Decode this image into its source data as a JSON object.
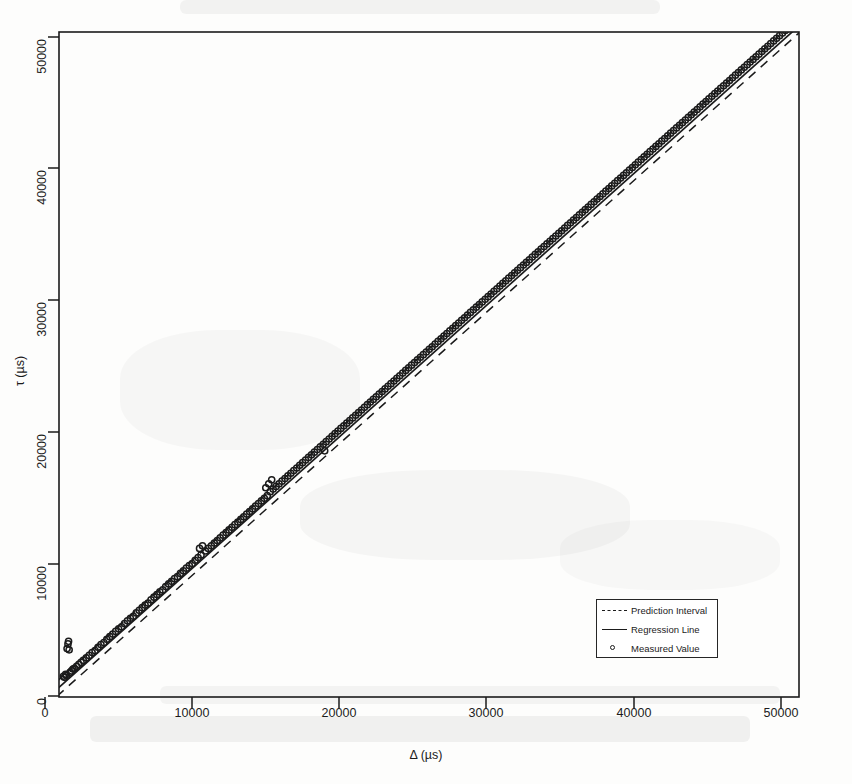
{
  "chart_data": {
    "type": "scatter",
    "title": "",
    "xlabel": "Δ (µs)",
    "ylabel": "τ (µs)",
    "xlim": [
      -1200,
      52500
    ],
    "ylim": [
      -1200,
      52500
    ],
    "xticks": [
      0,
      10000,
      20000,
      30000,
      40000,
      50000
    ],
    "yticks": [
      0,
      10000,
      20000,
      30000,
      40000,
      50000
    ],
    "xticklabels": [
      "0",
      "10000",
      "20000",
      "30000",
      "40000",
      "50000"
    ],
    "yticklabels": [
      "0",
      "10000",
      "20000",
      "30000",
      "40000",
      "50000"
    ],
    "grid": false,
    "legend_position": "bottom-right",
    "series": [
      {
        "name": "Measured Value",
        "type": "scatter",
        "marker": "open-circle",
        "color": "#1b1b1b",
        "points": [
          [
            1250,
            1500
          ],
          [
            1320,
            1420
          ],
          [
            1400,
            1650
          ],
          [
            1460,
            1560
          ],
          [
            1500,
            3600
          ],
          [
            1560,
            3950
          ],
          [
            1600,
            4150
          ],
          [
            1640,
            3500
          ],
          [
            1700,
            1800
          ],
          [
            1800,
            1900
          ],
          [
            1900,
            2050
          ],
          [
            2000,
            2100
          ],
          [
            2150,
            2250
          ],
          [
            2300,
            2400
          ],
          [
            2450,
            2550
          ],
          [
            2600,
            2700
          ],
          [
            2800,
            2900
          ],
          [
            3000,
            3080
          ],
          [
            3200,
            3300
          ],
          [
            3400,
            3450
          ],
          [
            3600,
            3700
          ],
          [
            3800,
            3900
          ],
          [
            4000,
            4050
          ],
          [
            4200,
            4300
          ],
          [
            4400,
            4500
          ],
          [
            4600,
            4700
          ],
          [
            4800,
            4900
          ],
          [
            5000,
            5100
          ],
          [
            5200,
            5250
          ],
          [
            5400,
            5500
          ],
          [
            5600,
            5700
          ],
          [
            5800,
            5900
          ],
          [
            6000,
            6050
          ],
          [
            6200,
            6300
          ],
          [
            6400,
            6500
          ],
          [
            6600,
            6700
          ],
          [
            6800,
            6900
          ],
          [
            7000,
            7050
          ],
          [
            7200,
            7300
          ],
          [
            7400,
            7500
          ],
          [
            7600,
            7700
          ],
          [
            7800,
            7900
          ],
          [
            8000,
            8050
          ],
          [
            8200,
            8300
          ],
          [
            8400,
            8500
          ],
          [
            8600,
            8700
          ],
          [
            8800,
            8900
          ],
          [
            9000,
            9050
          ],
          [
            9200,
            9300
          ],
          [
            9400,
            9500
          ],
          [
            9600,
            9700
          ],
          [
            9800,
            9900
          ],
          [
            10000,
            10050
          ],
          [
            10200,
            10300
          ],
          [
            10400,
            10500
          ],
          [
            10600,
            10700
          ],
          [
            10500,
            11200
          ],
          [
            10700,
            11400
          ],
          [
            10900,
            11000
          ],
          [
            11100,
            11200
          ],
          [
            11300,
            11400
          ],
          [
            11500,
            11600
          ],
          [
            11700,
            11800
          ],
          [
            11900,
            12000
          ],
          [
            12100,
            12200
          ],
          [
            12300,
            12400
          ],
          [
            12500,
            12600
          ],
          [
            12700,
            12800
          ],
          [
            12900,
            13000
          ],
          [
            13100,
            13200
          ],
          [
            13300,
            13400
          ],
          [
            13500,
            13600
          ],
          [
            13700,
            13800
          ],
          [
            13900,
            14000
          ],
          [
            14100,
            14200
          ],
          [
            14300,
            14400
          ],
          [
            14500,
            14600
          ],
          [
            14700,
            14800
          ],
          [
            14900,
            15000
          ],
          [
            15100,
            15200
          ],
          [
            15000,
            15800
          ],
          [
            15200,
            16100
          ],
          [
            15400,
            16400
          ],
          [
            15300,
            15500
          ],
          [
            15500,
            15700
          ],
          [
            15700,
            15900
          ],
          [
            15900,
            16100
          ],
          [
            16100,
            16300
          ],
          [
            16300,
            16500
          ],
          [
            16500,
            16700
          ],
          [
            16700,
            16900
          ],
          [
            16900,
            17100
          ],
          [
            17100,
            17300
          ],
          [
            17300,
            17500
          ],
          [
            17500,
            17700
          ],
          [
            17700,
            17900
          ],
          [
            17900,
            18100
          ],
          [
            18100,
            18300
          ],
          [
            18300,
            18500
          ],
          [
            18500,
            18700
          ],
          [
            19000,
            18600
          ],
          [
            18700,
            18900
          ],
          [
            18900,
            19100
          ],
          [
            19100,
            19300
          ],
          [
            19300,
            19500
          ],
          [
            19500,
            19700
          ],
          [
            19700,
            19900
          ],
          [
            19900,
            20100
          ],
          [
            20100,
            20300
          ],
          [
            20300,
            20500
          ],
          [
            20500,
            20700
          ],
          [
            20700,
            20900
          ],
          [
            20900,
            21100
          ],
          [
            21100,
            21300
          ],
          [
            21300,
            21500
          ],
          [
            21500,
            21700
          ],
          [
            21700,
            21900
          ],
          [
            21900,
            22100
          ],
          [
            22100,
            22300
          ],
          [
            22300,
            22500
          ],
          [
            22500,
            22700
          ],
          [
            22700,
            22900
          ],
          [
            22900,
            23100
          ],
          [
            23100,
            23300
          ],
          [
            23300,
            23500
          ],
          [
            23500,
            23700
          ],
          [
            23700,
            23900
          ],
          [
            23900,
            24100
          ],
          [
            24100,
            24300
          ],
          [
            24300,
            24500
          ],
          [
            24500,
            24700
          ],
          [
            24700,
            24900
          ],
          [
            24900,
            25100
          ],
          [
            25100,
            25300
          ],
          [
            25300,
            25500
          ],
          [
            25500,
            25700
          ],
          [
            25700,
            25900
          ],
          [
            25900,
            26100
          ],
          [
            26100,
            26300
          ],
          [
            26300,
            26500
          ],
          [
            26500,
            26700
          ],
          [
            26700,
            26900
          ],
          [
            26900,
            27100
          ],
          [
            27100,
            27300
          ],
          [
            27300,
            27500
          ],
          [
            27500,
            27700
          ],
          [
            27700,
            27900
          ],
          [
            27900,
            28100
          ],
          [
            28100,
            28300
          ],
          [
            28300,
            28500
          ],
          [
            28500,
            28700
          ],
          [
            28700,
            28900
          ],
          [
            28900,
            29100
          ],
          [
            29100,
            29300
          ],
          [
            29300,
            29500
          ],
          [
            29500,
            29700
          ],
          [
            29700,
            29900
          ],
          [
            29900,
            30100
          ],
          [
            30100,
            30300
          ],
          [
            30300,
            30500
          ],
          [
            30500,
            30700
          ],
          [
            30700,
            30900
          ],
          [
            30900,
            31100
          ],
          [
            31100,
            31300
          ],
          [
            31300,
            31500
          ],
          [
            31500,
            31700
          ],
          [
            31700,
            31900
          ],
          [
            31900,
            32100
          ],
          [
            32100,
            32300
          ],
          [
            32300,
            32500
          ],
          [
            32500,
            32700
          ],
          [
            32700,
            32900
          ],
          [
            32900,
            33100
          ],
          [
            33100,
            33300
          ],
          [
            33300,
            33500
          ],
          [
            33500,
            33700
          ],
          [
            33700,
            33900
          ],
          [
            33900,
            34100
          ],
          [
            34100,
            34300
          ],
          [
            34300,
            34500
          ],
          [
            34500,
            34700
          ],
          [
            34700,
            34900
          ],
          [
            34900,
            35100
          ],
          [
            35100,
            35300
          ],
          [
            35300,
            35500
          ],
          [
            35500,
            35700
          ],
          [
            35700,
            35900
          ],
          [
            35900,
            36100
          ],
          [
            36100,
            36300
          ],
          [
            36300,
            36500
          ],
          [
            36500,
            36700
          ],
          [
            36700,
            36900
          ],
          [
            36900,
            37100
          ],
          [
            37100,
            37300
          ],
          [
            37300,
            37500
          ],
          [
            37500,
            37700
          ],
          [
            37700,
            37900
          ],
          [
            37900,
            38100
          ],
          [
            38100,
            38300
          ],
          [
            38300,
            38500
          ],
          [
            38500,
            38700
          ],
          [
            38700,
            38900
          ],
          [
            38900,
            39100
          ],
          [
            39100,
            39300
          ],
          [
            39300,
            39500
          ],
          [
            39500,
            39700
          ],
          [
            39700,
            39900
          ],
          [
            39900,
            40100
          ],
          [
            40100,
            40300
          ],
          [
            40300,
            40500
          ],
          [
            40500,
            40700
          ],
          [
            40700,
            40900
          ],
          [
            40900,
            41100
          ],
          [
            41100,
            41300
          ],
          [
            41300,
            41500
          ],
          [
            41500,
            41700
          ],
          [
            41700,
            41900
          ],
          [
            41900,
            42100
          ],
          [
            42100,
            42300
          ],
          [
            42300,
            42500
          ],
          [
            42500,
            42700
          ],
          [
            42700,
            42900
          ],
          [
            42900,
            43100
          ],
          [
            43100,
            43300
          ],
          [
            43300,
            43500
          ],
          [
            43500,
            43700
          ],
          [
            43700,
            43900
          ],
          [
            43900,
            44100
          ],
          [
            44100,
            44300
          ],
          [
            44300,
            44500
          ],
          [
            44500,
            44700
          ],
          [
            44700,
            44900
          ],
          [
            44900,
            45100
          ],
          [
            45100,
            45300
          ],
          [
            45300,
            45500
          ],
          [
            45500,
            45700
          ],
          [
            45700,
            45900
          ],
          [
            45900,
            46100
          ],
          [
            46100,
            46300
          ],
          [
            46300,
            46500
          ],
          [
            46500,
            46700
          ],
          [
            46700,
            46900
          ],
          [
            46900,
            47100
          ],
          [
            47100,
            47300
          ],
          [
            47300,
            47500
          ],
          [
            47500,
            47700
          ],
          [
            47700,
            47900
          ],
          [
            47900,
            48100
          ],
          [
            48100,
            48300
          ],
          [
            48300,
            48500
          ],
          [
            48500,
            48700
          ],
          [
            48700,
            48900
          ],
          [
            48900,
            49100
          ],
          [
            49100,
            49300
          ],
          [
            49300,
            49500
          ],
          [
            49500,
            49700
          ],
          [
            49700,
            49900
          ],
          [
            49900,
            50100
          ],
          [
            50100,
            50300
          ],
          [
            50300,
            50500
          ],
          [
            50500,
            50700
          ]
        ]
      },
      {
        "name": "Regression Line",
        "type": "line",
        "style": "solid",
        "color": "#1b1b1b",
        "slope": 1.005,
        "intercept": 120,
        "endpoints": [
          [
            -900,
            -785
          ],
          [
            50900,
            51275
          ]
        ]
      },
      {
        "name": "Prediction Interval",
        "type": "line",
        "style": "dashed",
        "color": "#1b1b1b",
        "upper_endpoints": [
          [
            -900,
            -230
          ],
          [
            50900,
            51800
          ]
        ],
        "lower_endpoints": [
          [
            -900,
            -1340
          ],
          [
            50900,
            50750
          ]
        ]
      }
    ],
    "annotations": [
      {
        "text": "outlier point",
        "x": 19000,
        "y": 18600
      },
      {
        "text": "low-range outlier cluster",
        "x": 1550,
        "y": 3800
      }
    ]
  },
  "legend": {
    "entries": [
      {
        "label": "Prediction Interval",
        "key": "dashed-line"
      },
      {
        "label": "Regression Line",
        "key": "solid-line"
      },
      {
        "label": "Measured Value",
        "key": "open-circle-marker"
      }
    ]
  }
}
